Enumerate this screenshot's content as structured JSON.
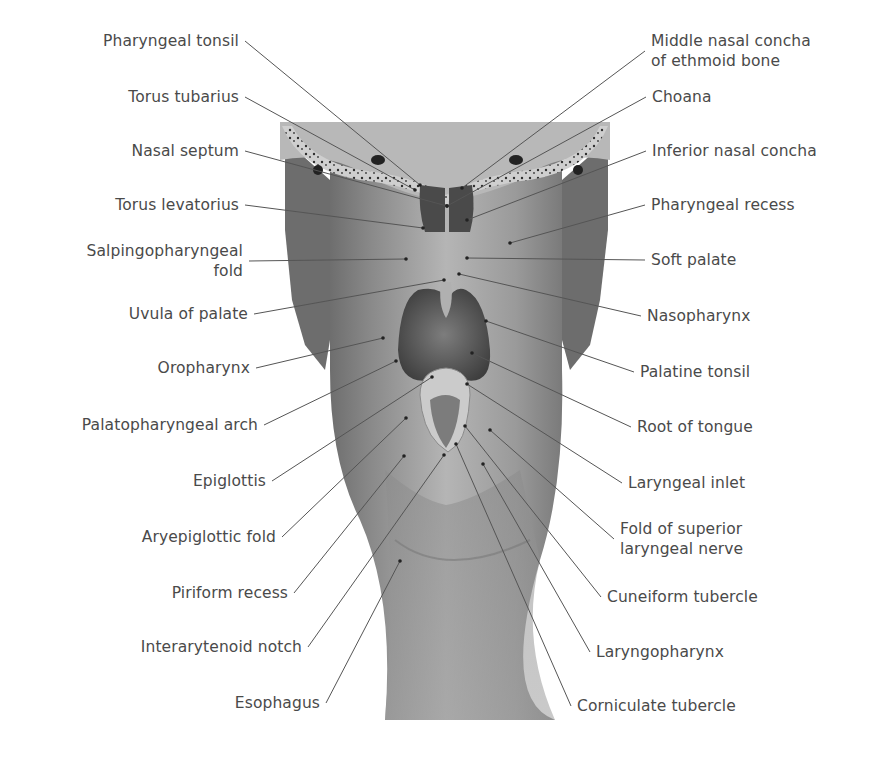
{
  "figure": {
    "colors": {
      "text": "#4a4a4a",
      "leader": "#555555",
      "background": "#ffffff"
    },
    "labels_left": [
      {
        "lines": [
          "Pharyngeal tonsil"
        ],
        "x": 239,
        "y": 41,
        "tip": [
          420,
          185
        ]
      },
      {
        "lines": [
          "Torus tubarius"
        ],
        "x": 239,
        "y": 97,
        "tip": [
          415,
          190
        ]
      },
      {
        "lines": [
          "Nasal septum"
        ],
        "x": 239,
        "y": 151,
        "tip": [
          447,
          206
        ]
      },
      {
        "lines": [
          "Torus levatorius"
        ],
        "x": 239,
        "y": 205,
        "tip": [
          423,
          228
        ]
      },
      {
        "lines": [
          "Salpingopharyngeal",
          "fold"
        ],
        "x": 243,
        "y": 251,
        "tip": [
          406,
          259
        ]
      },
      {
        "lines": [
          "Uvula of palate"
        ],
        "x": 248,
        "y": 314,
        "tip": [
          444,
          280
        ]
      },
      {
        "lines": [
          "Oropharynx"
        ],
        "x": 250,
        "y": 368,
        "tip": [
          383,
          338
        ]
      },
      {
        "lines": [
          "Palatopharyngeal arch"
        ],
        "x": 258,
        "y": 425,
        "tip": [
          396,
          361
        ]
      },
      {
        "lines": [
          "Epiglottis"
        ],
        "x": 266,
        "y": 481,
        "tip": [
          432,
          377
        ]
      },
      {
        "lines": [
          "Aryepiglottic fold"
        ],
        "x": 276,
        "y": 537,
        "tip": [
          406,
          418
        ]
      },
      {
        "lines": [
          "Piriform recess"
        ],
        "x": 288,
        "y": 593,
        "tip": [
          404,
          456
        ]
      },
      {
        "lines": [
          "Interarytenoid notch"
        ],
        "x": 302,
        "y": 647,
        "tip": [
          444,
          455
        ]
      },
      {
        "lines": [
          "Esophagus"
        ],
        "x": 320,
        "y": 703,
        "tip": [
          400,
          561
        ]
      }
    ],
    "labels_right": [
      {
        "lines": [
          "Middle nasal concha",
          "of ethmoid bone"
        ],
        "x": 651,
        "y": 41,
        "tip": [
          462,
          188
        ]
      },
      {
        "lines": [
          "Choana"
        ],
        "x": 652,
        "y": 97,
        "tip": [
          447,
          206
        ]
      },
      {
        "lines": [
          "Inferior nasal concha"
        ],
        "x": 652,
        "y": 151,
        "tip": [
          467,
          220
        ]
      },
      {
        "lines": [
          "Pharyngeal recess"
        ],
        "x": 651,
        "y": 205,
        "tip": [
          510,
          243
        ]
      },
      {
        "lines": [
          "Soft palate"
        ],
        "x": 651,
        "y": 260,
        "tip": [
          467,
          258
        ]
      },
      {
        "lines": [
          "Nasopharynx"
        ],
        "x": 647,
        "y": 316,
        "tip": [
          459,
          274
        ]
      },
      {
        "lines": [
          "Palatine tonsil"
        ],
        "x": 640,
        "y": 372,
        "tip": [
          486,
          321
        ]
      },
      {
        "lines": [
          "Root of tongue"
        ],
        "x": 637,
        "y": 427,
        "tip": [
          472,
          353
        ]
      },
      {
        "lines": [
          "Laryngeal inlet"
        ],
        "x": 628,
        "y": 483,
        "tip": [
          467,
          384
        ]
      },
      {
        "lines": [
          "Fold of superior",
          "laryngeal nerve"
        ],
        "x": 620,
        "y": 529,
        "tip": [
          490,
          430
        ]
      },
      {
        "lines": [
          "Cuneiform tubercle"
        ],
        "x": 607,
        "y": 597,
        "tip": [
          465,
          426
        ]
      },
      {
        "lines": [
          "Laryngopharynx"
        ],
        "x": 596,
        "y": 652,
        "tip": [
          483,
          464
        ]
      },
      {
        "lines": [
          "Corniculate tubercle"
        ],
        "x": 577,
        "y": 706,
        "tip": [
          456,
          444
        ]
      }
    ]
  }
}
